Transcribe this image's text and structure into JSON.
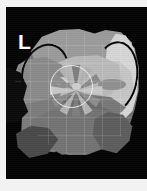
{
  "figure": {
    "domain": "medical-imaging-figure",
    "modality_appearance": "grayscale tomographic / 3d-rendered cross-section",
    "background_color": "#040404",
    "page_border_color": "#f2f2f2",
    "canvas": {
      "x": 6,
      "y": 7,
      "width": 141,
      "height": 172
    }
  },
  "annotations": {
    "laterality_marker": {
      "label": "L",
      "meaning": "left-side orientation marker",
      "color": "#ffffff",
      "position": {
        "x": 12,
        "y": 24
      }
    }
  },
  "overlays": {
    "roi_circle": {
      "name": "region-of-interest circle",
      "stroke_color": "#f0f0f0",
      "center": {
        "x": 65,
        "y": 80
      },
      "radius": 21
    },
    "grid": {
      "visible": true,
      "spacing_px": 18,
      "color": "rgba(255,255,255,0.13)"
    },
    "arcs": [
      {
        "name": "left measurement arc",
        "color": "#070707",
        "side": "left"
      },
      {
        "name": "right measurement arc",
        "color": "#060606",
        "side": "right"
      }
    ]
  },
  "structures": {
    "body_outline": {
      "label": "faceted body contour",
      "fill": "#6e6e6e"
    },
    "upper_band": {
      "label": "superior light band",
      "fill": "#9b9b9b"
    },
    "bright_right_lobe": {
      "label": "bright right lobe",
      "fill": "#d6d6d6"
    },
    "right_plateau": {
      "label": "right light plateau",
      "fill": "#c6c6c6"
    },
    "central_wedge": {
      "label": "central light wedge",
      "fill": "#b9b9b9"
    },
    "left_flank": {
      "label": "left flank",
      "fill": "#8a8a8a"
    },
    "left_notch": {
      "label": "left dark notch",
      "fill": "#0b0b0b"
    },
    "lower_left_block": {
      "label": "inferior left block",
      "fill": "#7c7c7c"
    },
    "lower_band": {
      "label": "inferior band",
      "fill": "#747474"
    },
    "lower_right_shoulder": {
      "label": "inferior right shoulder",
      "fill": "#5d5d5d"
    },
    "lower_left_wedge": {
      "label": "inferior left wedge",
      "fill": "#4a4a4a"
    },
    "shading_sweep": {
      "label": "mid-body shading sweep",
      "fill": "#6a6a6a"
    },
    "center_core": {
      "label": "central bright core",
      "fill": "#cfcfcf"
    },
    "left_ellipse": {
      "label": "left lateral ellipse",
      "fill": "#8e8e8e"
    },
    "right_ellipse": {
      "label": "right lateral ellipse",
      "fill": "#8f8f8f"
    },
    "left_bright_blob": {
      "label": "left bright blob",
      "fill": "#cdcdcd"
    }
  },
  "radial_pattern": {
    "name": "central bowtie radial pattern",
    "ray_count": 12,
    "rays": [
      {
        "angle": 0,
        "color": "#c9c9c9"
      },
      {
        "angle": 30,
        "color": "#8d8d8d"
      },
      {
        "angle": 60,
        "color": "#b4b4b4"
      },
      {
        "angle": 90,
        "color": "#7f7f7f"
      },
      {
        "angle": 120,
        "color": "#b0b0b0"
      },
      {
        "angle": 150,
        "color": "#8a8a8a"
      },
      {
        "angle": 180,
        "color": "#c9c9c9"
      },
      {
        "angle": 210,
        "color": "#8d8d8d"
      },
      {
        "angle": 240,
        "color": "#b4b4b4"
      },
      {
        "angle": 270,
        "color": "#7f7f7f"
      },
      {
        "angle": 300,
        "color": "#b0b0b0"
      },
      {
        "angle": 330,
        "color": "#8a8a8a"
      }
    ]
  }
}
